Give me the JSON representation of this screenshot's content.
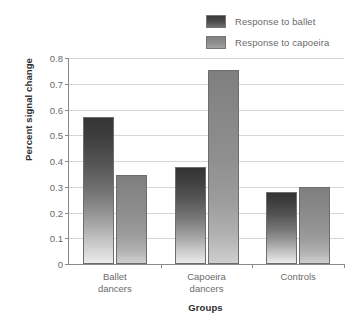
{
  "chart_data": {
    "type": "bar",
    "title": "",
    "xlabel": "Groups",
    "ylabel": "Percent signal change",
    "categories": [
      "Ballet\ndancers",
      "Capoeira\ndancers",
      "Controls"
    ],
    "category_lines": [
      [
        "Ballet",
        "dancers"
      ],
      [
        "Capoeira",
        "dancers"
      ],
      [
        "Controls"
      ]
    ],
    "series": [
      {
        "name": "Response to ballet",
        "values": [
          0.57,
          0.375,
          0.28
        ],
        "color": "#3d3d3d"
      },
      {
        "name": "Response to capoeira",
        "values": [
          0.345,
          0.755,
          0.3
        ],
        "color": "#8d8d8d"
      }
    ],
    "ylim": [
      0,
      0.8
    ],
    "ytick_values": [
      0,
      0.1,
      0.2,
      0.3,
      0.4,
      0.5,
      0.6,
      0.7,
      0.8
    ],
    "ytick_labels": [
      "0",
      "0.1",
      "0.2",
      "0.3",
      "0.4",
      "0.5",
      "0.6",
      "0.7",
      "0.8"
    ],
    "grid": true,
    "grid_axis": "y",
    "legend_position": "top-right"
  },
  "legend": {
    "items": [
      {
        "label": "Response to ballet",
        "swatch": "series-0-swatch"
      },
      {
        "label": "Response to capoeira",
        "swatch": "series-1-swatch"
      }
    ]
  }
}
